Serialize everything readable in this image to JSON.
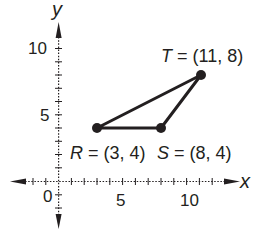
{
  "diagram": {
    "type": "coordinate-plane",
    "x_axis": {
      "label": "x",
      "tick_labels": [
        "5",
        "10"
      ],
      "origin_label": "0"
    },
    "y_axis": {
      "label": "y",
      "tick_labels": [
        "5",
        "10"
      ]
    },
    "points": [
      {
        "name": "R",
        "x": 3,
        "y": 4,
        "label": "R = (3, 4)"
      },
      {
        "name": "S",
        "x": 8,
        "y": 4,
        "label": "S = (8, 4)"
      },
      {
        "name": "T",
        "x": 11,
        "y": 8,
        "label": "T = (11, 8)"
      }
    ],
    "segments": [
      [
        "R",
        "S"
      ],
      [
        "S",
        "T"
      ],
      [
        "T",
        "R"
      ]
    ],
    "colors": {
      "ink": "#231f20",
      "background": "#ffffff"
    }
  },
  "labels": {
    "x_axis": "x",
    "y_axis": "y",
    "x5": "5",
    "x10": "10",
    "y5": "5",
    "y10": "10",
    "origin": "0",
    "R_name": "R",
    "R_coords": " = (3, 4)",
    "S_name": "S",
    "S_coords": " = (8, 4)",
    "T_name": "T",
    "T_coords": " = (11, 8)"
  }
}
